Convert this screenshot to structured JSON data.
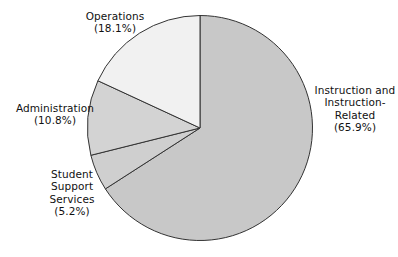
{
  "chart_data": {
    "type": "pie",
    "title": "",
    "subtitle": "",
    "xlabel": "",
    "ylabel": "",
    "legend_position": "none",
    "grid": false,
    "units": "percent",
    "start_angle_deg": 0,
    "direction": "clockwise",
    "categories": [
      "Instruction and Instruction-Related",
      "Student Support Services",
      "Administration",
      "Operations"
    ],
    "values": [
      65.9,
      5.2,
      10.8,
      18.1
    ],
    "slices": [
      {
        "name": "Instruction and Instruction-Related",
        "value": 65.9,
        "value_text": "(65.9%)",
        "label_lines": [
          "Instruction and",
          "Instruction-",
          "Related",
          "(65.9%)"
        ],
        "color": "#c8c8c8",
        "start_deg": 0,
        "end_deg": 237.24
      },
      {
        "name": "Student Support Services",
        "value": 5.2,
        "value_text": "(5.2%)",
        "label_lines": [
          "Student",
          "Support",
          "Services",
          "(5.2%)"
        ],
        "color": "#cfcfcf",
        "start_deg": 237.24,
        "end_deg": 255.96
      },
      {
        "name": "Administration",
        "value": 10.8,
        "value_text": "(10.8%)",
        "label_lines": [
          "Administration",
          "(10.8%)"
        ],
        "color": "#d3d3d3",
        "start_deg": 255.96,
        "end_deg": 294.84
      },
      {
        "name": "Operations",
        "value": 18.1,
        "value_text": "(18.1%)",
        "label_lines": [
          "Operations",
          "(18.1%)"
        ],
        "color": "#f1f1f1",
        "start_deg": 294.84,
        "end_deg": 360.0
      }
    ],
    "stroke_color": "#333333",
    "background_color": "#ffffff"
  },
  "labels": {
    "instruction": "Instruction and\nInstruction-\nRelated\n(65.9%)",
    "operations": "Operations\n(18.1%)",
    "administration": "Administration\n(10.8%)",
    "student_support": "Student\nSupport\nServices\n(5.2%)"
  }
}
